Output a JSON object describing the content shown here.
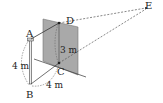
{
  "diagram": {
    "type": "3d-geometry-figure",
    "points": {
      "A": "A",
      "B": "B",
      "C": "C",
      "D": "D",
      "E": "E"
    },
    "measurements": {
      "AB": "4 m",
      "BC": "4 m",
      "CD": "3 m"
    },
    "colors": {
      "panel": "#a8a8a8",
      "line": "#333333",
      "dashed": "#555555"
    }
  }
}
